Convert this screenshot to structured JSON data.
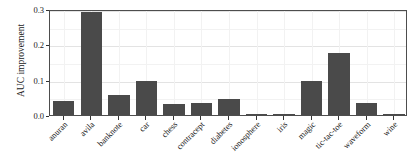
{
  "chart_data": {
    "type": "bar",
    "title": "",
    "subtitle": "",
    "xlabel": "",
    "ylabel": "AUC improvement",
    "ylim": [
      0.0,
      0.3
    ],
    "yticks": [
      0.0,
      0.1,
      0.2,
      0.3
    ],
    "ytick_labels": [
      "0.0",
      "0.1",
      "0.2",
      "0.3"
    ],
    "grid": true,
    "legend": "none",
    "orientation": "vertical",
    "bar_color": "#4a4a4a",
    "panel_background": "#ffffff",
    "gridline_color": "#e3e3e3",
    "axis_color": "#4d4d4d",
    "categories": [
      "anuran",
      "avila",
      "banknote",
      "car",
      "chess",
      "contracept",
      "diabetes",
      "ionosphere",
      "iris",
      "magic",
      "tic-tac-toe",
      "waveform",
      "wine"
    ],
    "values": [
      0.04,
      0.291,
      0.058,
      0.096,
      0.032,
      0.033,
      0.046,
      0.004,
      0.001,
      0.095,
      0.176,
      0.035,
      0.004
    ]
  }
}
